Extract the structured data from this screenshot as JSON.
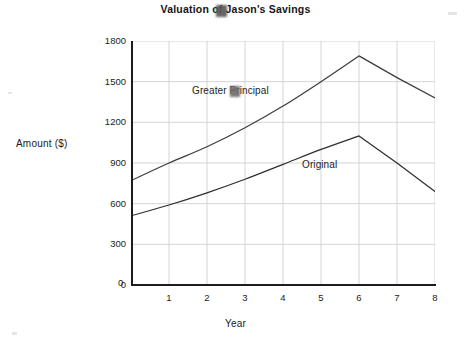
{
  "chart_data": {
    "type": "line",
    "title": "Valuation of Jason's Savings",
    "xlabel": "Year",
    "ylabel": "Amount ($)",
    "xlim": [
      0,
      8
    ],
    "ylim": [
      0,
      1800
    ],
    "grid": true,
    "legend_position": "inline-labels",
    "x_tick_labels": [
      "0",
      "1",
      "2",
      "3",
      "4",
      "5",
      "6",
      "7",
      "8"
    ],
    "y_tick_labels": [
      "0",
      "300",
      "600",
      "900",
      "1200",
      "1500",
      "1800"
    ],
    "x_ticks": [
      0,
      1,
      2,
      3,
      4,
      5,
      6,
      7,
      8
    ],
    "y_ticks": [
      0,
      300,
      600,
      900,
      1200,
      1500,
      1800
    ],
    "x": [
      0,
      1,
      2,
      3,
      4,
      5,
      6,
      7,
      8
    ],
    "series": [
      {
        "name": "Greater Principal",
        "color": "#3d3d3d",
        "values": [
          770,
          900,
          1020,
          1160,
          1320,
          1500,
          1690,
          1530,
          1380
        ]
      },
      {
        "name": "Original",
        "color": "#2e2e2e",
        "values": [
          510,
          590,
          680,
          780,
          890,
          1000,
          1100,
          900,
          690
        ]
      }
    ],
    "annotations": [
      {
        "text": "Greater Principal",
        "series": "Greater Principal"
      },
      {
        "text": "Original",
        "series": "Original"
      }
    ]
  },
  "axes": {
    "y_title": "Amount ($)",
    "x_title": "Year",
    "x_zero_label": "0"
  },
  "style": {
    "background": "#ffffff",
    "grid_color": "#c9c9c9",
    "axis_color": "#1c1c1c",
    "text_color": "#1a1a1a"
  }
}
